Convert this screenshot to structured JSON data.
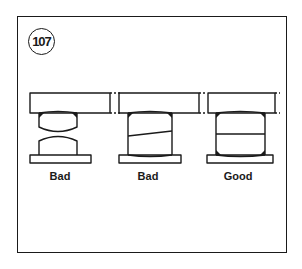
{
  "figure": {
    "number": "107",
    "panels": [
      {
        "label": "Bad",
        "variant": "double-crowned-hourglass"
      },
      {
        "label": "Bad",
        "variant": "tapered-stack"
      },
      {
        "label": "Good",
        "variant": "flat-stacked"
      }
    ]
  },
  "colors": {
    "ink": "#1a1a1a",
    "background": "#ffffff"
  }
}
